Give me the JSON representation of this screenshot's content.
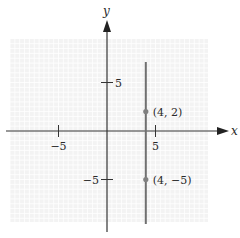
{
  "chart_data": {
    "type": "line",
    "title": "",
    "xlabel": "x",
    "ylabel": "y",
    "xlim": [
      -10,
      10
    ],
    "ylim": [
      -10,
      10
    ],
    "grid": true,
    "x_ticks": [
      {
        "value": -5,
        "label": "−5"
      },
      {
        "value": 5,
        "label": "5"
      }
    ],
    "y_ticks": [
      {
        "value": 5,
        "label": "5"
      },
      {
        "value": -5,
        "label": "−5"
      }
    ],
    "series": [
      {
        "name": "x = 4",
        "kind": "vertical-line",
        "x": 4
      }
    ],
    "points": [
      {
        "x": 4,
        "y": 2,
        "label": "(4, 2)"
      },
      {
        "x": 4,
        "y": -5,
        "label": "(4, −5)"
      }
    ]
  },
  "colors": {
    "grid": "#e6e6e6",
    "grid_bg": "#f3f3f3",
    "axis": "#333333",
    "line": "#707070",
    "point": "#808080"
  }
}
